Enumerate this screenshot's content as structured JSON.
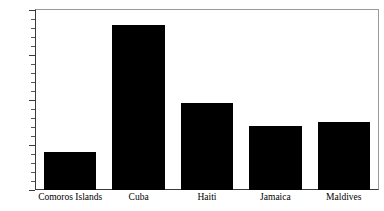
{
  "chart_data": {
    "type": "bar",
    "title": "",
    "subtitle": "",
    "xlabel": "",
    "ylabel": "",
    "categories": [
      "Comoros Islands",
      "Cuba",
      "Haiti",
      "Jamaica",
      "Maldives"
    ],
    "values": [
      2100,
      9150,
      4850,
      3550,
      3800
    ],
    "ylim": [
      0,
      10000
    ],
    "xlim": [
      0,
      5
    ],
    "y_ticks": [
      0,
      2500,
      5000,
      7500,
      10000
    ],
    "y_tick_labels": [
      "0",
      "2,500",
      "5,000",
      "7,500",
      "10,000"
    ],
    "y_minor_tick_step": 500,
    "grid": false,
    "legend": null,
    "legend_position": "none",
    "bar_color": "#000000",
    "background_color": "#ffffff",
    "axis_color": "#3a3a3a",
    "frame_color": "#9a9a9a",
    "annotations": []
  },
  "axes": {
    "y_axis_name": "y-axis",
    "x_axis_name": "x-axis"
  }
}
